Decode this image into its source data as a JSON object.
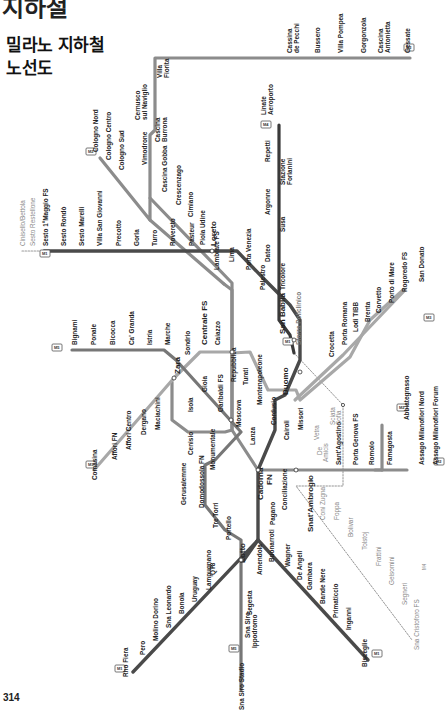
{
  "page": {
    "heading_partial": "지하철",
    "title_line1": "밀라노 지하철",
    "title_line2": "노선도",
    "page_number": "314"
  },
  "colors": {
    "M1": "#4a4a4a",
    "M2": "#8c8c8c",
    "M3": "#3a3a3a",
    "M4": "#777777",
    "M5": "#a8a8a8",
    "dot": "#ffffff"
  },
  "lines": {
    "M1": {
      "badge": "M1",
      "branch_sesto": [
        "Sesto 1°Maggio FS",
        "Sesto Rondò",
        "Sesto Marelli",
        "Villa San Giovanni",
        "Precotto",
        "Gorla",
        "Turro",
        "Rovereto",
        "Pasteur",
        "Loreto",
        "Lima",
        "Porta Venezia",
        "Palestro",
        "San Babila",
        "Duomo",
        "Cordusio",
        "Cairoli",
        "Cadorna FN",
        "Conciliazione",
        "Pagano"
      ],
      "branch_rho": [
        "Buonarroti",
        "Amendola",
        "Lotto",
        "QT8",
        "Lampugnano",
        "Uruguay",
        "Bonola",
        "Sna Leonardo",
        "Molino Dorino",
        "Pero",
        "Rho Fiera"
      ],
      "branch_bisceglie": [
        "Wagner",
        "De Angeli",
        "Gambara",
        "Bande Nere",
        "Primaticcio",
        "Inganni",
        "Bisceglie"
      ],
      "future_extension": [
        "Cinisello/Bettola",
        "Sesto Restellone"
      ]
    },
    "M2": {
      "badge": "M2",
      "main": [
        "Gessate",
        "Cascina Antonietta",
        "Gorgonzola",
        "Villa Pompea",
        "Bussero",
        "Cassina de Pecchi",
        "Villa Fiorita",
        "Cernusco sul Naviglio",
        "Cascina Burrona",
        "Vimodrone",
        "Cascina Gobba",
        "Crescenzago",
        "Cimiano",
        "Udine",
        "Lambrate FS",
        "Piola",
        "Loreto",
        "Caiazzo",
        "Centrale FS",
        "Gioia",
        "Garibaldi FS",
        "Moscova",
        "Lanza",
        "Cadorna FN",
        "Sant'Ambrogio",
        "Sant'Agostino",
        "Porta Genova FS",
        "Romolo",
        "Famagosta",
        "Abbiategrasso"
      ],
      "branch_cologno": [
        "Cologno Nord",
        "Cologno Centro",
        "Cologno Sud"
      ],
      "branch_assago": [
        "Assago Milanofiori Nord",
        "Assago Milanofiori Forum"
      ]
    },
    "M3": {
      "badge": "M3",
      "stations": [
        "Comasina",
        "Affori FN",
        "Affori Centro",
        "Dergano",
        "Maciachini",
        "Zara",
        "Sondrio",
        "Centrale FS",
        "Repubblica",
        "Turati",
        "Montenapoleone",
        "Duomo",
        "Missori",
        "Crocetta",
        "Porta Romana",
        "Lodi TIBB",
        "Brenta",
        "Corvetto",
        "Porto di Mare",
        "Rogoredo FS",
        "San Donato"
      ]
    },
    "M4": {
      "badge": "M4",
      "linate_badge": "M4",
      "stations_east": [
        "Linate Aeroporto",
        "Repetti",
        "Stazione Forlanini",
        "Argonne",
        "Susa",
        "Dateo",
        "Tricolore",
        "San Babila"
      ],
      "future_west": [
        "Sforza Policlinico",
        "Vetra",
        "Sciata Sofia",
        "De Amicis",
        "Sant'Ambrogio",
        "Coni Zugna",
        "Foppa",
        "Bolivar",
        "Tolstoj",
        "Frattini",
        "Gelsomini",
        "Segneri",
        "Sna Cristoforo FS"
      ],
      "end_label": "M4"
    },
    "M5": {
      "badge": "M5",
      "stations": [
        "Bignami",
        "Ponale",
        "Bicocca",
        "Ca' Granda",
        "Istria",
        "Marche",
        "Zara",
        "Isola",
        "Garibaldi FS",
        "Monumentale",
        "Cenisio",
        "Gerusalemme",
        "Domodossola FN",
        "Tre Torri",
        "Portello",
        "Lotto",
        "Segesta",
        "Sna Siro Ippodromo",
        "Sna Siro Stadio"
      ]
    }
  },
  "labels": {
    "sesto_1": "Sesto 1°Maggio FS",
    "sesto_r": "Sesto Rondò",
    "sesto_m": "Sesto Marelli",
    "villa_sg": "Villa San Giovanni",
    "precotto": "Precotto",
    "gorla": "Gorla",
    "turro": "Turro",
    "rovereto": "Rovereto",
    "pasteur": "Pasteur",
    "loreto": "Loreto",
    "lima": "Lima",
    "pv": "Porta Venezia",
    "palestro": "Palestro",
    "sanbabila": "San Babila",
    "duomo": "Duomo",
    "cordusio": "Cordusio",
    "cairoli": "Cairoli",
    "cadorna1": "Cadorna",
    "cadorna2": "FN",
    "conciliazione": "Conciliazione",
    "pagano": "Pagano",
    "buonarroti": "Buonarroti",
    "amendola": "Amendola",
    "lotto": "Lotto",
    "qt8": "QT8",
    "lampugnano": "Lampugnano",
    "uruguay": "Uruguay",
    "bonola": "Bonola",
    "snaleonardo": "Sna Leonardo",
    "molino": "Molino Dorino",
    "pero": "Pero",
    "rho": "Rho Fiera",
    "wagner": "Wagner",
    "deangeli": "De Angeli",
    "gambara": "Gambara",
    "bandenere": "Bande Nere",
    "primaticcio": "Primaticcio",
    "inganni": "Inganni",
    "bisceglie": "Bisceglie",
    "cinisello": "Cinisello/Bettola",
    "restellone": "Sesto Restellone",
    "gessate": "Gessate",
    "cantonietta1": "Cascina",
    "cantonietta2": "Antonietta",
    "gorgonzola": "Gorgonzola",
    "villapompea": "Villa Pompea",
    "bussero": "Bussero",
    "cassina1": "Cassina",
    "cassina2": "de Pecchi",
    "villafiorita1": "Villa",
    "villafiorita2": "Fiorita",
    "cernusco1": "Cernusco",
    "cernusco2": "sul Naviglio",
    "burrona1": "Cascina",
    "burrona2": "Burrona",
    "vimodrone": "Vimodrone",
    "gobba": "Cascina Gobba",
    "crescenzago": "Crescenzago",
    "cimiano": "Cimiano",
    "udine": "Udine",
    "lambrate": "Lambrate FS",
    "piola": "Piola",
    "caiazzo": "Caiazzo",
    "centrale": "Centrale FS",
    "gioia": "Gioia",
    "garibaldi": "Garibaldi FS",
    "moscova": "Moscova",
    "lanza": "Lanza",
    "santambrogio": "Snat'Ambrogio",
    "santagostino": "Sant'Agostino",
    "portagenova": "Porta Genova FS",
    "romolo": "Romolo",
    "famagosta": "Famagosta",
    "abbiategrasso": "Abbiategrasso",
    "colognoN": "Cologno Nord",
    "colognoC": "Cologno Centro",
    "colognoS": "Cologno Sud",
    "assagoN": "Assago Milanofiori Nord",
    "assagoF": "Assago Milanofiori Forum",
    "comasina": "Comasina",
    "afforifn": "Affori FN",
    "afforic": "Affori Centro",
    "dergano": "Dergano",
    "maciachini": "Maciachini",
    "zara": "Zara",
    "sondrio": "Sondrio",
    "repubblica": "Repubblica",
    "turati": "Turati",
    "montenapoleone": "Montenapoleone",
    "missori": "Missori",
    "crocetta": "Crocetta",
    "portaromana": "Porta Romana",
    "lodi": "Lodi TIBB",
    "brenta": "Brenta",
    "corvetto": "Corvetto",
    "portodimare": "Porto di Mare",
    "rogoredo": "Rogoredo FS",
    "sandonato": "San Donato",
    "linate1": "Linate",
    "linate2": "Aeroporto",
    "repetti": "Repetti",
    "forlanini1": "Stazione",
    "forlanini2": "Forlanini",
    "argonne": "Argonne",
    "susa": "Susa",
    "dateo": "Dateo",
    "tricolore": "Tricolore",
    "sforza": "Sforza Policlinico",
    "vetra": "Vetra",
    "sofia1": "Sciata",
    "sofia2": "Sofia",
    "deamicis1": "De",
    "deamicis2": "Amicis",
    "conizugna": "Coni Zugna",
    "foppa": "Foppa",
    "bolivar": "Bolivar",
    "tolstoj": "Tolstoj",
    "frattini": "Frattini",
    "gelsomini": "Gelsomini",
    "segneri": "Segneri",
    "sancristoforo": "Sna Cristoforo FS",
    "m4end": "M4",
    "bignami": "Bignami",
    "ponale": "Ponale",
    "bicocca": "Bicocca",
    "cagranda": "Ca' Granda",
    "istria": "Istria",
    "marche": "Marche",
    "isola": "Isola",
    "monumentale": "Monumentale",
    "cenisio": "Cenisio",
    "gerusalemme": "Gerusalemme",
    "domodossola": "Domodossola FN",
    "tretorri": "Tre Torri",
    "portello": "Portello",
    "segesta": "Segesta",
    "ippodromo1": "Sna Siro",
    "ippodromo2": "Ippodromo",
    "stadio": "Sna Siro Stadio"
  }
}
